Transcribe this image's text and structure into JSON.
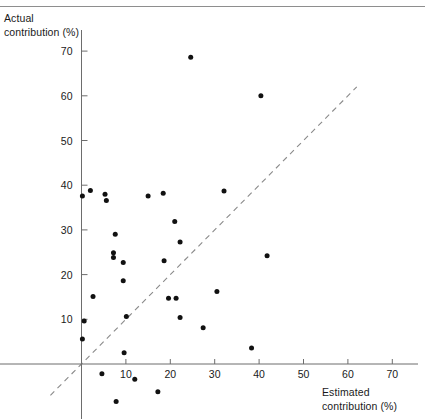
{
  "figure": {
    "ylabel": "Actual\ncontribution (%)",
    "xlabel": "Estimated\ncontribution (%)",
    "axis_color": "#6d6d6d",
    "point_color": "#111111",
    "reference_line_color": "#8a8a8a"
  },
  "chart_data": {
    "type": "scatter",
    "title": "",
    "xlabel": "Estimated contribution (%)",
    "ylabel": "Actual contribution (%)",
    "xlim": [
      -4,
      78
    ],
    "ylim": [
      -13,
      74
    ],
    "xticks": [
      10,
      20,
      30,
      40,
      50,
      60,
      70
    ],
    "yticks": [
      10,
      20,
      30,
      40,
      50,
      60,
      70
    ],
    "xtick_labels": [
      "10",
      "20",
      "30",
      "40",
      "50",
      "60",
      "70"
    ],
    "ytick_labels": [
      "10",
      "20",
      "30",
      "40",
      "50",
      "60",
      "70"
    ],
    "grid": false,
    "legend": "none",
    "annotations": [
      {
        "kind": "reference-line",
        "label": "y = x identity line (dashed)",
        "style": "dashed",
        "from": [
          -7,
          -7
        ],
        "to": [
          62,
          62
        ]
      }
    ],
    "points": [
      {
        "x": 0.2,
        "y": 37.6
      },
      {
        "x": 2.0,
        "y": 38.8
      },
      {
        "x": 5.3,
        "y": 38.0
      },
      {
        "x": 5.6,
        "y": 36.6
      },
      {
        "x": 15.0,
        "y": 37.6
      },
      {
        "x": 18.4,
        "y": 38.2
      },
      {
        "x": 21.0,
        "y": 31.9
      },
      {
        "x": 22.2,
        "y": 27.3
      },
      {
        "x": 7.6,
        "y": 29.0
      },
      {
        "x": 7.2,
        "y": 24.9
      },
      {
        "x": 7.2,
        "y": 23.8
      },
      {
        "x": 9.4,
        "y": 22.7
      },
      {
        "x": 18.6,
        "y": 23.1
      },
      {
        "x": 9.4,
        "y": 18.6
      },
      {
        "x": 2.6,
        "y": 15.1
      },
      {
        "x": 19.6,
        "y": 14.7
      },
      {
        "x": 21.3,
        "y": 14.7
      },
      {
        "x": 10.1,
        "y": 10.6
      },
      {
        "x": 0.6,
        "y": 9.6
      },
      {
        "x": 22.2,
        "y": 10.4
      },
      {
        "x": 27.4,
        "y": 8.1
      },
      {
        "x": 0.2,
        "y": 5.6
      },
      {
        "x": 9.6,
        "y": 2.5
      },
      {
        "x": 24.6,
        "y": 68.6
      },
      {
        "x": 40.4,
        "y": 60.0
      },
      {
        "x": 32.1,
        "y": 38.7
      },
      {
        "x": 41.8,
        "y": 24.2
      },
      {
        "x": 30.5,
        "y": 16.2
      },
      {
        "x": 38.3,
        "y": 3.6
      },
      {
        "x": 4.6,
        "y": -2.2
      },
      {
        "x": 12.0,
        "y": -3.4
      },
      {
        "x": 17.2,
        "y": -6.2
      },
      {
        "x": 7.8,
        "y": -8.4
      }
    ]
  }
}
